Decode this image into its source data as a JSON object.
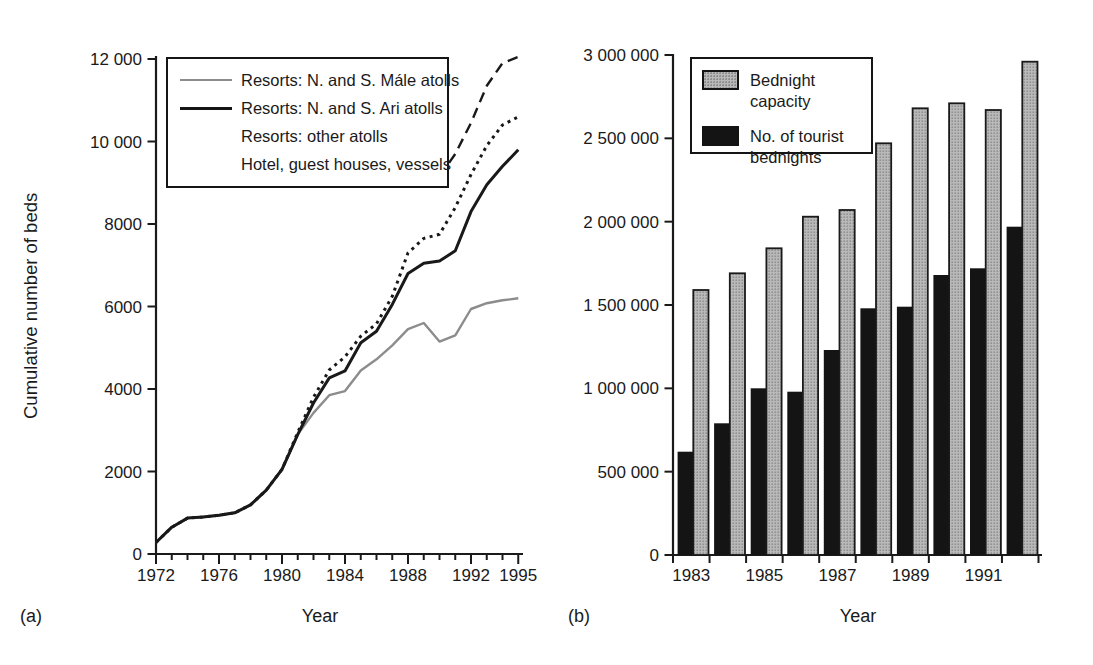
{
  "figure": {
    "background": "#ffffff",
    "ink_color": "#1a1a1a",
    "gray_line_color": "#8c8c8c",
    "bar_gray_color": "#b9b9b9",
    "bar_black_color": "#141414",
    "panel_a": {
      "tag": "(a)"
    },
    "panel_b": {
      "tag": "(b)"
    }
  },
  "chart_data": [
    {
      "id": "a",
      "type": "line",
      "title": "",
      "xlabel": "Year",
      "ylabel": "Cumulative number of beds",
      "grid": false,
      "legend_position": "top-left-inside",
      "xlim": [
        1972,
        1995.3
      ],
      "ylim": [
        0,
        12000
      ],
      "yticks": [
        0,
        2000,
        4000,
        6000,
        8000,
        10000,
        12000
      ],
      "ytick_labels": [
        "0",
        "2000",
        "4000",
        "6000",
        "8000",
        "10 000",
        "12 000"
      ],
      "xticks_labeled": [
        1972,
        1976,
        1980,
        1984,
        1988,
        1992,
        1995
      ],
      "xticks_minor_every": 1,
      "x": [
        1972,
        1973,
        1974,
        1975,
        1976,
        1977,
        1978,
        1979,
        1980,
        1981,
        1982,
        1983,
        1984,
        1985,
        1986,
        1987,
        1988,
        1989,
        1990,
        1991,
        1992,
        1993,
        1994,
        1995
      ],
      "series": [
        {
          "name": "Resorts: N. and S. Mále atolls",
          "style": "solid-gray",
          "color": "#8c8c8c",
          "values": [
            280,
            650,
            870,
            900,
            940,
            1000,
            1190,
            1550,
            2050,
            2900,
            3420,
            3850,
            3950,
            4450,
            4720,
            5060,
            5450,
            5600,
            5150,
            5300,
            5940,
            6080,
            6150,
            6200
          ]
        },
        {
          "name": "Resorts: N. and S. Ari atolls",
          "style": "solid-black",
          "color": "#1a1a1a",
          "values": [
            280,
            650,
            870,
            900,
            940,
            1000,
            1190,
            1550,
            2050,
            2900,
            3660,
            4270,
            4440,
            5120,
            5400,
            6050,
            6800,
            7050,
            7100,
            7350,
            8300,
            8950,
            9400,
            9800
          ]
        },
        {
          "name": "Resorts: other atolls",
          "style": "dotted",
          "color": "#1a1a1a",
          "values": [
            280,
            650,
            870,
            900,
            940,
            1000,
            1190,
            1550,
            2050,
            2950,
            3800,
            4460,
            4780,
            5280,
            5580,
            6250,
            7300,
            7650,
            7750,
            8400,
            9200,
            9900,
            10400,
            10600
          ]
        },
        {
          "name": "Hotel, guest houses, vessels",
          "style": "dashed",
          "color": "#1a1a1a",
          "values": [
            null,
            null,
            null,
            null,
            null,
            null,
            null,
            null,
            null,
            null,
            null,
            null,
            null,
            null,
            null,
            null,
            null,
            null,
            9150,
            9700,
            10450,
            11350,
            11900,
            12050
          ]
        }
      ]
    },
    {
      "id": "b",
      "type": "bar",
      "title": "",
      "xlabel": "Year",
      "ylabel": "",
      "grid": false,
      "legend_position": "top-left-inside",
      "ylim": [
        0,
        3000000
      ],
      "yticks": [
        0,
        500000,
        1000000,
        1500000,
        2000000,
        2500000,
        3000000
      ],
      "ytick_labels": [
        "0",
        "500 000",
        "1 000 000",
        "1 500 000",
        "2 000 000",
        "2 500 000",
        "3 000 000"
      ],
      "categories": [
        1983,
        1984,
        1985,
        1986,
        1987,
        1988,
        1989,
        1990,
        1991,
        1992
      ],
      "xtick_labels": [
        "1983",
        "1985",
        "1987",
        "1989",
        "1991"
      ],
      "xtick_label_groups": [
        0,
        2,
        4,
        6,
        8
      ],
      "series": [
        {
          "name": "Bednight capacity",
          "color": "gray-halftone",
          "values": [
            1590000,
            1690000,
            1840000,
            2030000,
            2070000,
            2470000,
            2680000,
            2710000,
            2670000,
            2960000
          ]
        },
        {
          "name": "No. of tourist bednights",
          "color": "black",
          "values": [
            620000,
            790000,
            1000000,
            980000,
            1230000,
            1480000,
            1490000,
            1680000,
            1720000,
            1970000
          ]
        }
      ]
    }
  ]
}
